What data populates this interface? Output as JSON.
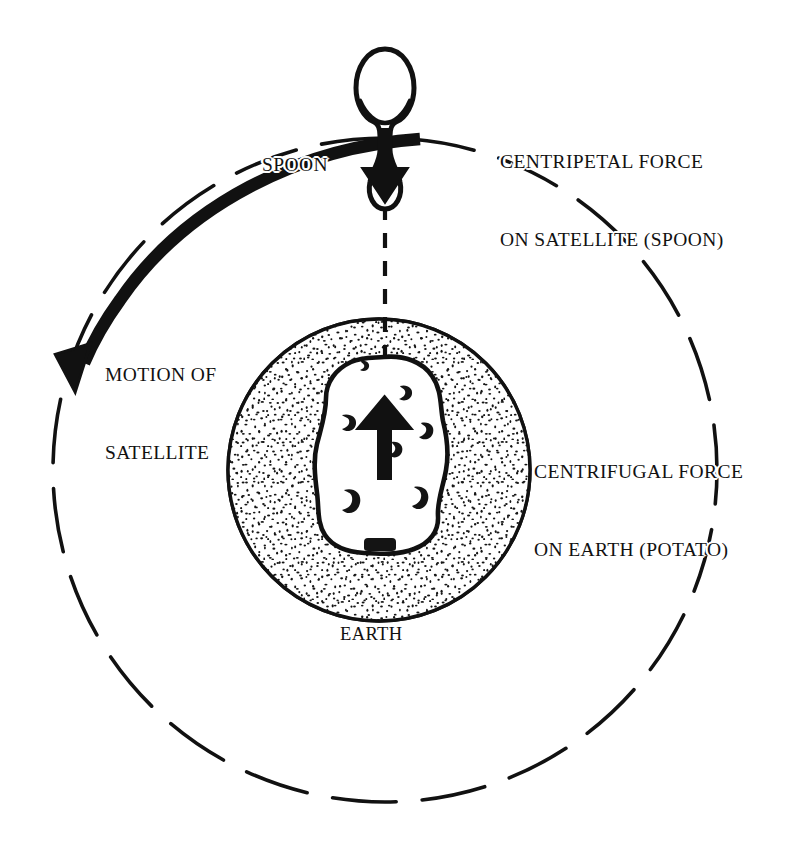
{
  "figure": {
    "background_color": "#ffffff",
    "ink_color": "#111111"
  },
  "labels": {
    "spoon": "SPOON",
    "centripetal_line1": "CENTRIPETAL FORCE",
    "centripetal_line2": "ON SATELLITE (SPOON)",
    "motion_line1": "MOTION OF",
    "motion_line2": "SATELLITE",
    "centrifugal_line1": "CENTRIFUGAL FORCE",
    "centrifugal_line2": "ON EARTH (POTATO)",
    "earth": "EARTH"
  },
  "elements": {
    "orbit_path": "orbit-dashed-circle",
    "motion_arc": "motion-arc-arrow",
    "earth_body": "earth-stippled-circle",
    "potato_body": "potato-outline",
    "spoon_body": "spoon-outline",
    "force_arrow_down": "centripetal-arrow-down",
    "force_arrow_up": "centrifugal-arrow-up",
    "radius_line": "dashed-radius-line"
  },
  "geometry": {
    "orbit_center_x": 385,
    "orbit_center_y": 470,
    "orbit_radius": 332,
    "earth_center_x": 379,
    "earth_center_y": 470,
    "earth_radius": 151,
    "spoon_x": 385,
    "spoon_top_y": 48,
    "spoon_bottom_y": 211,
    "motion_arrow_tip_x": 73,
    "motion_arrow_tip_y": 347
  },
  "colors": {
    "line": "#111111",
    "fill_white": "#ffffff",
    "stipple": "#1a1a1a"
  }
}
